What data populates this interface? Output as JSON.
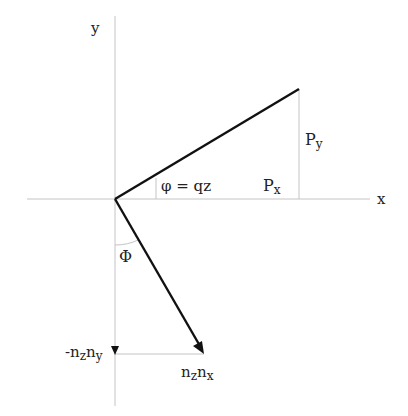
{
  "diagram": {
    "axes": {
      "x_label": "x",
      "y_label": "y",
      "color": "#bbbbbb"
    },
    "vectors": {
      "color": "#111111",
      "p_vector_label_parts": {
        "px": "P",
        "px_sub": "x",
        "py": "P",
        "py_sub": "y"
      },
      "n_vector_label_parts": {
        "n1": "n",
        "n1_sub": "z",
        "n2": "n",
        "n2_sub": "x"
      }
    },
    "angles": {
      "phi_small": "φ = qz",
      "phi_big": "Φ"
    },
    "projections": {
      "neg_ny_prefix": "-n",
      "neg_ny_sub1": "z",
      "neg_ny_mid": "n",
      "neg_ny_sub2": "y"
    }
  }
}
